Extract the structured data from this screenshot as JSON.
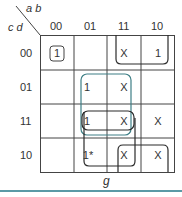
{
  "kmap": {
    "corner": {
      "top_vars": "a b",
      "left_vars": "c d"
    },
    "col_labels": [
      "00",
      "01",
      "11",
      "10"
    ],
    "row_labels": [
      "00",
      "01",
      "11",
      "10"
    ],
    "cells": [
      [
        "1",
        "",
        "X",
        "1"
      ],
      [
        "",
        "1",
        "X",
        ""
      ],
      [
        "",
        "1",
        "X",
        "X"
      ],
      [
        "",
        "1*",
        "X",
        "X"
      ]
    ],
    "output_label": "g",
    "colors": {
      "grid": "#333333",
      "teal_loop": "#3e7f86",
      "dark_loop": "#2b2b2b",
      "bottom_rule": "#5a9aa6"
    }
  }
}
